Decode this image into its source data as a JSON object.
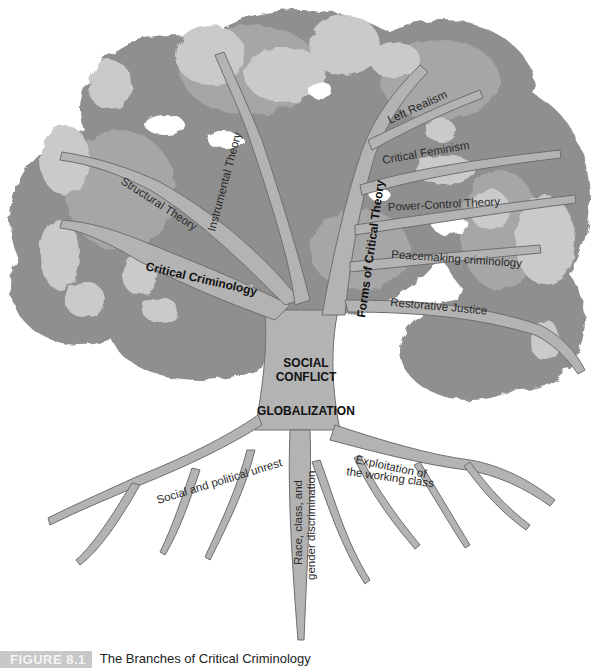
{
  "figure": {
    "number_label": "FIGURE 8.1",
    "caption": "The Branches of Critical Criminology"
  },
  "tree": {
    "canopy_colors": {
      "dark": "#8f8f8f",
      "mid": "#a6a6a6",
      "light": "#c9c9c9"
    },
    "wood_color": "#b3b3b3",
    "wood_outline": "#6e6e6e",
    "left_limb": {
      "label": "Critical Criminology",
      "branches": [
        "Structural Theory",
        "Instrumental Theory"
      ]
    },
    "right_limb": {
      "label": "Forms of Critical Theory",
      "branches": [
        "Left Realism",
        "Critical Feminism",
        "Power-Control Theory",
        "Peacemaking criminology",
        "Restorative Justice"
      ]
    },
    "trunk": {
      "line1": "SOCIAL",
      "line2": "CONFLICT",
      "line3": "GLOBALIZATION"
    },
    "roots": {
      "left": "Social and political unrest",
      "center_line1": "Race, class, and",
      "center_line2": "gender discrimination",
      "right_line1": "Exploitation of",
      "right_line2": "the working class"
    }
  }
}
